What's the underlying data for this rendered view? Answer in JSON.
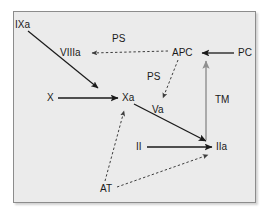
{
  "figure": {
    "kind": "coagulation-cascade-diagram",
    "background_color": "#ffffff",
    "panel_color": "#ebebeb",
    "panel_border_color": "#8c8c8c",
    "solid_edge_color": "#1a1a1a",
    "dashed_edge_color": "#4d4d4d",
    "gray_edge_color": "#8f8f8f"
  },
  "nodes": [
    {
      "id": "IXa",
      "label": "IXa",
      "x": 15,
      "y": 20
    },
    {
      "id": "VIIIa",
      "label": "VIIIa",
      "x": 60,
      "y": 48
    },
    {
      "id": "APC",
      "label": "APC",
      "x": 172,
      "y": 48
    },
    {
      "id": "PC",
      "label": "PC",
      "x": 238,
      "y": 48
    },
    {
      "id": "X",
      "label": "X",
      "x": 47,
      "y": 93
    },
    {
      "id": "Xa",
      "label": "Xa",
      "x": 122,
      "y": 93
    },
    {
      "id": "Va",
      "label": "Va",
      "x": 152,
      "y": 105
    },
    {
      "id": "II",
      "label": "II",
      "x": 136,
      "y": 142
    },
    {
      "id": "IIa",
      "label": "IIa",
      "x": 216,
      "y": 142
    },
    {
      "id": "AT",
      "label": "AT",
      "x": 100,
      "y": 184
    }
  ],
  "edge_labels": [
    {
      "id": "ps-viiia",
      "label": "PS",
      "x": 112,
      "y": 34
    },
    {
      "id": "ps-va",
      "label": "PS",
      "x": 147,
      "y": 72
    },
    {
      "id": "tm",
      "label": "TM",
      "x": 215,
      "y": 95
    }
  ],
  "edges": [
    {
      "id": "ixa-to-xa",
      "from": "IXa",
      "to": "Xa",
      "style": "solid",
      "color": "#1a1a1a",
      "meaning": "activation"
    },
    {
      "id": "x-to-xa",
      "from": "X",
      "to": "Xa",
      "style": "solid",
      "color": "#1a1a1a",
      "meaning": "activation"
    },
    {
      "id": "xa-to-iia",
      "from": "Xa",
      "to": "IIa",
      "style": "solid",
      "color": "#1a1a1a",
      "meaning": "activation"
    },
    {
      "id": "ii-to-iia",
      "from": "II",
      "to": "IIa",
      "style": "solid",
      "color": "#1a1a1a",
      "meaning": "activation"
    },
    {
      "id": "pc-to-apc",
      "from": "PC",
      "to": "APC",
      "style": "solid",
      "color": "#1a1a1a",
      "meaning": "activation"
    },
    {
      "id": "tm-iia-apc",
      "from": "IIa",
      "to": "APC",
      "style": "solid",
      "color": "#8f8f8f",
      "meaning": "thrombomodulin-mediated activation",
      "label": "TM"
    },
    {
      "id": "apc-to-viiia",
      "from": "APC",
      "to": "VIIIa",
      "style": "dashed",
      "color": "#4d4d4d",
      "meaning": "inactivation",
      "label": "PS"
    },
    {
      "id": "apc-to-va",
      "from": "APC",
      "to": "Va",
      "style": "dashed",
      "color": "#4d4d4d",
      "meaning": "inactivation",
      "label": "PS"
    },
    {
      "id": "at-to-xa",
      "from": "AT",
      "to": "Xa",
      "style": "dashed",
      "color": "#4d4d4d",
      "meaning": "inhibition"
    },
    {
      "id": "at-to-iia",
      "from": "AT",
      "to": "IIa",
      "style": "dashed",
      "color": "#4d4d4d",
      "meaning": "inhibition"
    }
  ]
}
